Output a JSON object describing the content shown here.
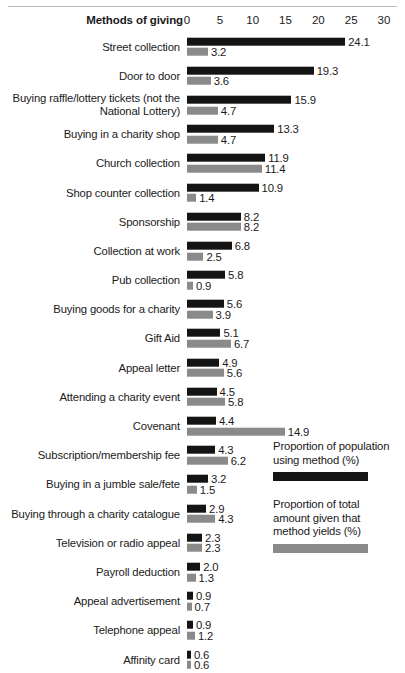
{
  "chart_data": {
    "type": "bar",
    "orientation": "horizontal",
    "title": "",
    "axis_title": "Methods of giving",
    "xlabel": "",
    "ylabel": "",
    "xlim": [
      0,
      30
    ],
    "ticks": [
      0,
      5,
      10,
      15,
      20,
      25,
      30
    ],
    "grid": false,
    "legend_position": "right-bottom",
    "colors": {
      "series_a": "#141414",
      "series_b": "#8a8a8a"
    },
    "categories": [
      "Street collection",
      "Door to door",
      "Buying raffle/lottery tickets (not the\nNational Lottery)",
      "Buying in a charity shop",
      "Church collection",
      "Shop counter collection",
      "Sponsorship",
      "Collection at work",
      "Pub collection",
      "Buying goods for a charity",
      "Gift Aid",
      "Appeal letter",
      "Attending a charity event",
      "Covenant",
      "Subscription/membership fee",
      "Buying in a jumble sale/fete",
      "Buying through a charity catalogue",
      "Television or radio appeal",
      "Payroll deduction",
      "Appeal advertisement",
      "Telephone appeal",
      "Affinity card"
    ],
    "series": [
      {
        "name": "Proportion of population\nusing method (%)",
        "key": "series_a",
        "values": [
          24.1,
          19.3,
          15.9,
          13.3,
          11.9,
          10.9,
          8.2,
          6.8,
          5.8,
          5.6,
          5.1,
          4.9,
          4.5,
          4.4,
          4.3,
          3.2,
          2.9,
          2.3,
          2.0,
          0.9,
          0.9,
          0.6
        ],
        "labels": [
          "24.1",
          "19.3",
          "15.9",
          "13.3",
          "11.9",
          "10.9",
          "8.2",
          "6.8",
          "5.8",
          "5.6",
          "5.1",
          "4.9",
          "4.5",
          "4.4",
          "4.3",
          "3.2",
          "2.9",
          "2.3",
          "2.0",
          "0.9",
          "0.9",
          "0.6"
        ]
      },
      {
        "name": "Proportion of total\namount given that\nmethod yields (%)",
        "key": "series_b",
        "values": [
          3.2,
          3.6,
          4.7,
          4.7,
          11.4,
          1.4,
          8.2,
          2.5,
          0.9,
          3.9,
          6.7,
          5.6,
          5.8,
          14.9,
          6.2,
          1.5,
          4.3,
          2.3,
          1.3,
          0.7,
          1.2,
          0.6
        ],
        "labels": [
          "3.2",
          "3.6",
          "4.7",
          "4.7",
          "11.4",
          "1.4",
          "8.2",
          "2.5",
          "0.9",
          "3.9",
          "6.7",
          "5.6",
          "5.8",
          "14.9",
          "6.2",
          "1.5",
          "4.3",
          "2.3",
          "1.3",
          "0.7",
          "1.2",
          "0.6"
        ]
      }
    ]
  },
  "legend": [
    {
      "text": "Proportion of population\nusing method (%)",
      "swatch": "series_a"
    },
    {
      "text": "Proportion of total\namount given that\nmethod yields (%)",
      "swatch": "series_b"
    }
  ]
}
